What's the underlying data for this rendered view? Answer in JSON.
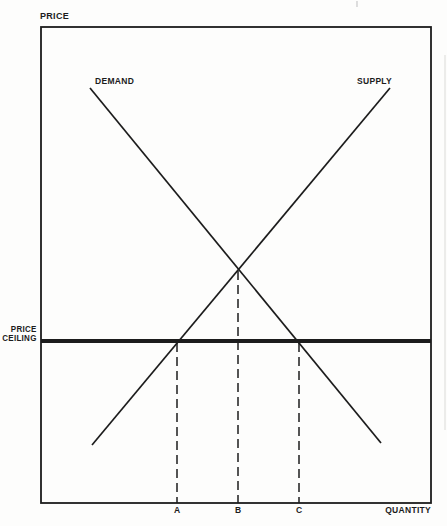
{
  "figure": {
    "y_axis_title": "PRICE",
    "x_axis_title": "QUANTITY",
    "curve_labels": {
      "demand": "DEMAND",
      "supply": "SUPPLY"
    },
    "ceiling_label": {
      "line1": "PRICE",
      "line2": "CEILING"
    }
  },
  "chart_data": {
    "type": "line",
    "title": "",
    "xlabel": "QUANTITY",
    "ylabel": "PRICE",
    "x_ticks": [
      "A",
      "B",
      "C"
    ],
    "legend": "none",
    "grid": false,
    "colors": {
      "ink": "#1c1c1c",
      "background": "#fdfdfc"
    },
    "box": {
      "x": 41,
      "y": 27,
      "w": 390,
      "h": 476,
      "stroke_width": 1.8
    },
    "lines": [
      {
        "name": "demand-curve",
        "label": "DEMAND",
        "x1": 90,
        "y1": 88,
        "x2": 381,
        "y2": 443,
        "width": 1.7,
        "dash": ""
      },
      {
        "name": "supply-curve",
        "label": "SUPPLY",
        "x1": 92,
        "y1": 445,
        "x2": 390,
        "y2": 88,
        "width": 1.7,
        "dash": ""
      },
      {
        "name": "price-ceiling-line",
        "label": "PRICE CEILING",
        "x1": 41,
        "y1": 341,
        "x2": 431,
        "y2": 341,
        "width": 3.8,
        "dash": ""
      },
      {
        "name": "dropline-a",
        "label": "A",
        "x1": 177,
        "y1": 343,
        "x2": 177,
        "y2": 503,
        "width": 1.5,
        "dash": "9 5"
      },
      {
        "name": "dropline-b",
        "label": "B",
        "x1": 238,
        "y1": 271,
        "x2": 238,
        "y2": 503,
        "width": 1.5,
        "dash": "9 5"
      },
      {
        "name": "dropline-c",
        "label": "C",
        "x1": 299,
        "y1": 343,
        "x2": 299,
        "y2": 503,
        "width": 1.5,
        "dash": "9 5"
      },
      {
        "name": "scan-speck-top",
        "label": "",
        "x1": 357,
        "y1": 1,
        "x2": 357,
        "y2": 7,
        "width": 1.2,
        "dash": "",
        "color": "#c9c9c9"
      },
      {
        "name": "scan-edge-right",
        "label": "",
        "x1": 445,
        "y1": 55,
        "x2": 445,
        "y2": 430,
        "width": 2,
        "dash": "",
        "color": "#ececea"
      }
    ],
    "intersections": [
      {
        "name": "equilibrium",
        "x": 238,
        "y": 270
      },
      {
        "name": "supply-meets-ceiling",
        "x": 177,
        "y": 341
      },
      {
        "name": "demand-meets-ceiling",
        "x": 299,
        "y": 341
      }
    ]
  }
}
